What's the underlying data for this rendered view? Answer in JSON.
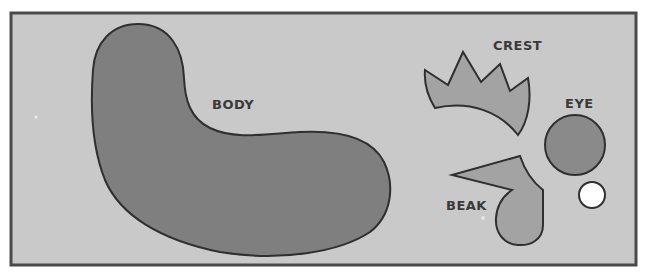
{
  "diagram": {
    "type": "cutout-template",
    "colors": {
      "page_background": "#ffffff",
      "panel_background": "#c9c9c9",
      "frame": "#4a4a4a",
      "outline": "#2f2f2f",
      "body_fill": "#7f7f7f",
      "crest_fill": "#a3a3a3",
      "eye_fill": "#8a8a8a",
      "beak_fill": "#a3a3a3",
      "pupil_fill": "#ffffff",
      "label_color": "#3a3a3a"
    },
    "pieces": [
      {
        "id": "body",
        "label": "BODY"
      },
      {
        "id": "crest",
        "label": "CREST"
      },
      {
        "id": "eye",
        "label": "EYE"
      },
      {
        "id": "beak",
        "label": "BEAK"
      },
      {
        "id": "pupil",
        "label": ""
      }
    ]
  }
}
